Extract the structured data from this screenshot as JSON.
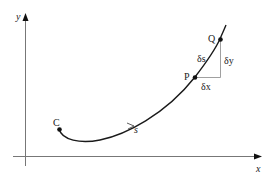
{
  "diagram": {
    "type": "arc-length-element",
    "axes": {
      "x_label": "x",
      "y_label": "y",
      "axis_color": "#777777"
    },
    "curve": {
      "color": "#1a1a1a",
      "start_label": "C",
      "direction_label": "s"
    },
    "points": [
      {
        "id": "C",
        "label": "C"
      },
      {
        "id": "P",
        "label": "P"
      },
      {
        "id": "Q",
        "label": "Q"
      }
    ],
    "triangle": {
      "hyp_label": "δs",
      "vert_label": "δy",
      "horiz_label": "δx",
      "color": "#888888"
    }
  }
}
